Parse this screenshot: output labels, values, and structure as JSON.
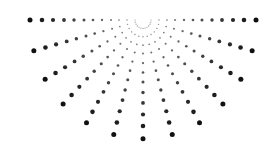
{
  "graphic": {
    "type": "radial-halftone-sunburst",
    "background": "#ffffff",
    "dot_color": "#111111",
    "center": {
      "x": 143,
      "y": 20
    },
    "vertical_scale": 1.05,
    "ray_angles_deg": [
      0,
      15,
      30,
      45,
      60,
      75,
      90,
      105,
      120,
      135,
      150,
      165,
      180
    ],
    "radii": [
      8,
      16,
      24,
      32,
      41,
      50,
      59,
      69,
      79,
      90,
      101,
      113
    ],
    "dot_radius_min": 0.6,
    "dot_radius_max": 2.5
  }
}
